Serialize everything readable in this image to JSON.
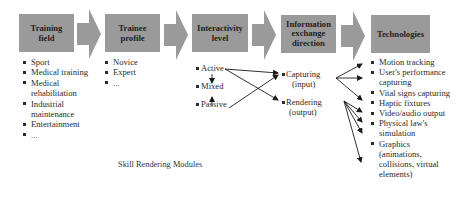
{
  "stages": [
    {
      "id": "training-field",
      "title_lines": [
        "Training",
        "field"
      ]
    },
    {
      "id": "trainee-profile",
      "title_lines": [
        "Trainee",
        "profile"
      ]
    },
    {
      "id": "interactivity-level",
      "title_lines": [
        "Interactivity",
        "level"
      ]
    },
    {
      "id": "information-exchange-direction",
      "title_lines": [
        "Information",
        "exchange",
        "direction"
      ]
    },
    {
      "id": "technologies",
      "title_lines": [
        "Technologies"
      ]
    }
  ],
  "training_field": {
    "items": [
      "Sport",
      "Medical training",
      "Medical rehabilitation",
      "Industrial maintenance",
      "Entertainment",
      "..."
    ]
  },
  "trainee_profile": {
    "items": [
      "Novice",
      "Expert",
      "..."
    ]
  },
  "interactivity_level": {
    "items": [
      "Active",
      "Mixed",
      "Passive"
    ]
  },
  "information_exchange": {
    "items": [
      "Capturing (input)",
      "Rendering (output)"
    ],
    "capturing_lines": [
      "Capturing",
      "(input)"
    ],
    "rendering_lines": [
      "Rendering",
      "(output)"
    ]
  },
  "technologies": {
    "items": [
      "Motion tracking",
      "User's performance capturing",
      "Vital signs capturing",
      "Haptic fixtures",
      "Video/audio output",
      "Physical law's simulation",
      "Graphics (animations, collisions, virtual elements)"
    ]
  },
  "caption": "Skill Rendering Modules",
  "colors": {
    "box": "#9a9a9a",
    "arrow": "#9a9a9a",
    "text": "#2b2b2b"
  }
}
